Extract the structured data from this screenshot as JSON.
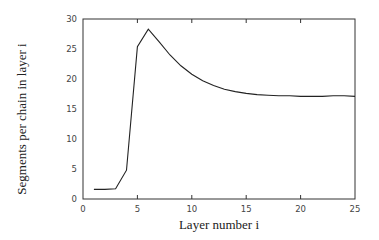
{
  "chart_data": {
    "type": "line",
    "title": "",
    "xlabel": "Layer number i",
    "ylabel": "Segments per chain in layer i",
    "xlim": [
      0,
      25
    ],
    "ylim": [
      0,
      30
    ],
    "xticks": [
      0,
      5,
      10,
      15,
      20,
      25
    ],
    "yticks": [
      0,
      5,
      10,
      15,
      20,
      25,
      30
    ],
    "grid": false,
    "legend": null,
    "series": [
      {
        "name": "segments",
        "color": "#222222",
        "x": [
          1,
          2,
          3,
          4,
          5,
          6,
          7,
          8,
          9,
          10,
          11,
          12,
          13,
          14,
          15,
          16,
          17,
          18,
          19,
          20,
          21,
          22,
          23,
          24,
          25
        ],
        "y": [
          1.6,
          1.6,
          1.7,
          4.8,
          25.4,
          28.3,
          26.2,
          24.0,
          22.2,
          20.8,
          19.7,
          18.9,
          18.3,
          17.9,
          17.6,
          17.4,
          17.3,
          17.2,
          17.2,
          17.1,
          17.1,
          17.1,
          17.2,
          17.2,
          17.1
        ]
      }
    ]
  }
}
